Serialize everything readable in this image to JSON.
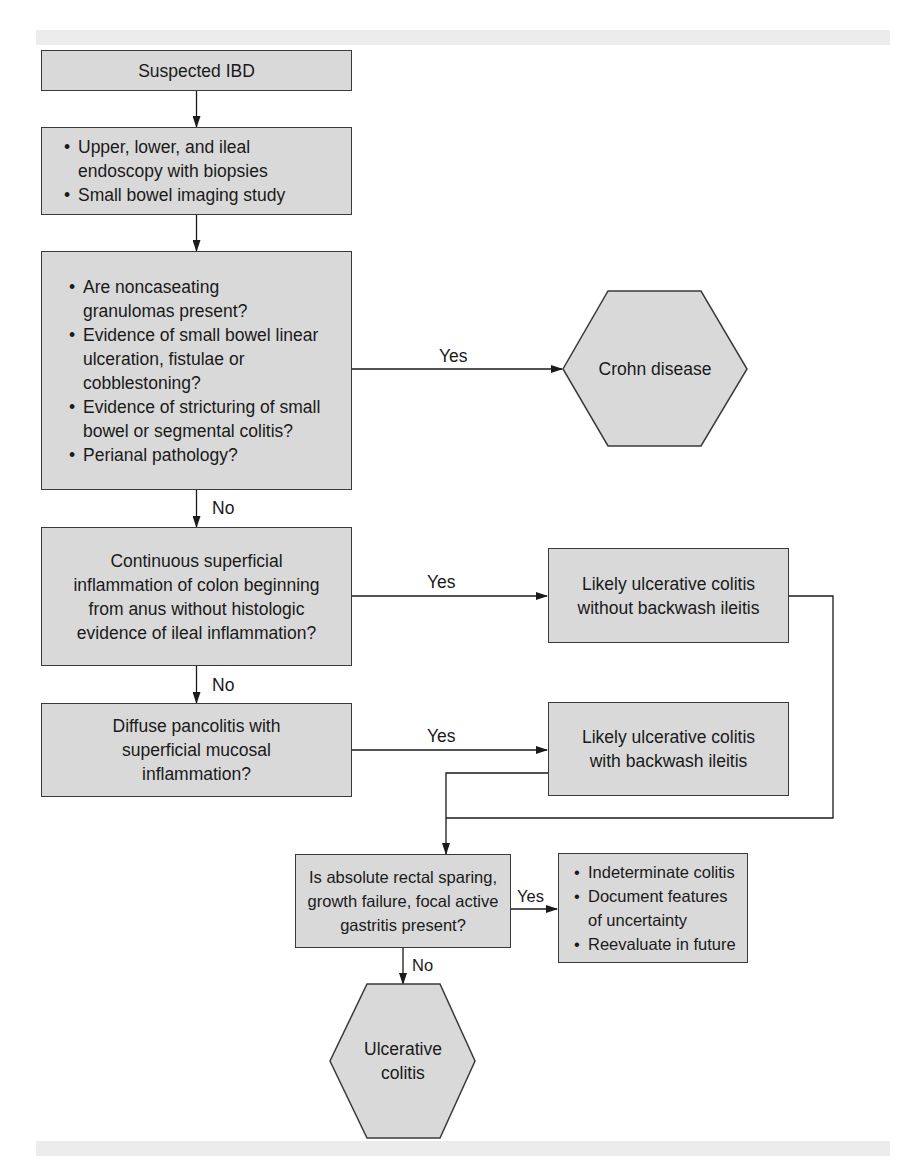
{
  "diagram": {
    "type": "flowchart",
    "colors": {
      "box_fill": "#d9d9d9",
      "box_border": "#3a3a3a",
      "band": "#ececec",
      "line": "#1a1a1a"
    },
    "nodes": {
      "start": {
        "text": "Suspected IBD"
      },
      "workup": {
        "items": [
          "Upper, lower, and ileal endoscopy with biopsies",
          "Small bowel imaging study"
        ]
      },
      "crohn_criteria": {
        "items": [
          "Are noncaseating granulomas present?",
          "Evidence of small bowel linear ulceration, fistulae or cobblestoning?",
          "Evidence of stricturing of small bowel or segmental colitis?",
          "Perianal pathology?"
        ]
      },
      "crohn_result": {
        "text": "Crohn disease"
      },
      "continuous_inflammation": {
        "text": "Continuous superficial inflammation of colon beginning from anus without histologic evidence of ileal inflammation?"
      },
      "uc_without_backwash": {
        "text": "Likely ulcerative colitis without backwash ileitis"
      },
      "diffuse_pancolitis": {
        "text": "Diffuse pancolitis with superficial mucosal inflammation?"
      },
      "uc_with_backwash": {
        "text": "Likely ulcerative colitis with backwash ileitis"
      },
      "atypical_features": {
        "text": "Is absolute rectal sparing, growth failure, focal active gastritis present?"
      },
      "indeterminate": {
        "items": [
          "Indeterminate colitis",
          "Document features of uncertainty",
          "Reevaluate in future"
        ]
      },
      "uc_result": {
        "text": "Ulcerative colitis"
      }
    },
    "edge_labels": {
      "crohn_yes": "Yes",
      "crohn_no": "No",
      "continuous_yes": "Yes",
      "continuous_no": "No",
      "pancolitis_yes": "Yes",
      "atypical_yes": "Yes",
      "atypical_no": "No"
    },
    "edges": [
      {
        "from": "start",
        "to": "workup",
        "label": ""
      },
      {
        "from": "workup",
        "to": "crohn_criteria",
        "label": ""
      },
      {
        "from": "crohn_criteria",
        "to": "crohn_result",
        "label": "Yes"
      },
      {
        "from": "crohn_criteria",
        "to": "continuous_inflammation",
        "label": "No"
      },
      {
        "from": "continuous_inflammation",
        "to": "uc_without_backwash",
        "label": "Yes"
      },
      {
        "from": "continuous_inflammation",
        "to": "diffuse_pancolitis",
        "label": "No"
      },
      {
        "from": "diffuse_pancolitis",
        "to": "uc_with_backwash",
        "label": "Yes"
      },
      {
        "from": "uc_without_backwash",
        "to": "atypical_features",
        "label": ""
      },
      {
        "from": "uc_with_backwash",
        "to": "atypical_features",
        "label": ""
      },
      {
        "from": "atypical_features",
        "to": "indeterminate",
        "label": "Yes"
      },
      {
        "from": "atypical_features",
        "to": "uc_result",
        "label": "No"
      }
    ]
  }
}
